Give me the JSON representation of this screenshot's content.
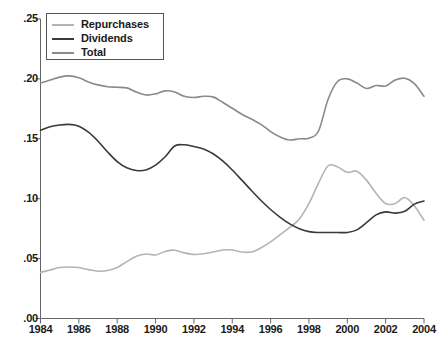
{
  "chart_data": {
    "type": "line",
    "title": "",
    "subtitle": "",
    "xlabel": "",
    "ylabel": "",
    "xlim": [
      1984,
      2004
    ],
    "ylim": [
      0.0,
      0.25
    ],
    "grid": false,
    "legend_position": "top-left",
    "x_tick_labels": [
      "1984",
      "1986",
      "1988",
      "1990",
      "1992",
      "1994",
      "1996",
      "1998",
      "2000",
      "2002",
      "2004"
    ],
    "x_ticks": [
      1984,
      1986,
      1988,
      1990,
      1992,
      1994,
      1996,
      1998,
      2000,
      2002,
      2004
    ],
    "y_tick_labels": [
      ".00",
      ".05",
      ".10",
      ".15",
      ".20",
      ".25"
    ],
    "y_ticks": [
      0.0,
      0.05,
      0.1,
      0.15,
      0.2,
      0.25
    ],
    "x": [
      1984.0,
      1984.5,
      1985.0,
      1985.5,
      1986.0,
      1986.5,
      1987.0,
      1987.5,
      1988.0,
      1988.5,
      1989.0,
      1989.5,
      1990.0,
      1990.5,
      1991.0,
      1991.5,
      1992.0,
      1992.5,
      1993.0,
      1993.5,
      1994.0,
      1994.5,
      1995.0,
      1995.5,
      1996.0,
      1996.5,
      1997.0,
      1997.5,
      1998.0,
      1998.5,
      1999.0,
      1999.5,
      2000.0,
      2000.5,
      2001.0,
      2001.5,
      2002.0,
      2002.5,
      2003.0,
      2003.5,
      2004.0
    ],
    "series": [
      {
        "name": "Repurchases",
        "color": "#b4b4b4",
        "values": [
          0.0385,
          0.0405,
          0.0425,
          0.043,
          0.0425,
          0.0408,
          0.0395,
          0.04,
          0.0425,
          0.0475,
          0.052,
          0.0538,
          0.053,
          0.056,
          0.057,
          0.0548,
          0.0535,
          0.054,
          0.0555,
          0.0572,
          0.0572,
          0.0555,
          0.0555,
          0.059,
          0.064,
          0.07,
          0.076,
          0.083,
          0.096,
          0.113,
          0.1275,
          0.1265,
          0.122,
          0.123,
          0.1155,
          0.1045,
          0.096,
          0.096,
          0.101,
          0.094,
          0.082
        ]
      },
      {
        "name": "Dividends",
        "color": "#3a3a3a",
        "values": [
          0.1572,
          0.16,
          0.1615,
          0.162,
          0.1605,
          0.1555,
          0.148,
          0.139,
          0.131,
          0.1258,
          0.1235,
          0.124,
          0.128,
          0.135,
          0.144,
          0.145,
          0.1435,
          0.1415,
          0.1375,
          0.1315,
          0.124,
          0.1155,
          0.1068,
          0.0985,
          0.091,
          0.0845,
          0.079,
          0.075,
          0.0725,
          0.0718,
          0.0718,
          0.0718,
          0.0718,
          0.074,
          0.08,
          0.0865,
          0.089,
          0.088,
          0.0895,
          0.0955,
          0.098
        ]
      },
      {
        "name": "Total",
        "color": "#8a8a8a",
        "values": [
          0.1965,
          0.199,
          0.2015,
          0.2025,
          0.201,
          0.1975,
          0.195,
          0.1935,
          0.193,
          0.1925,
          0.189,
          0.1865,
          0.1875,
          0.19,
          0.189,
          0.1855,
          0.1845,
          0.1855,
          0.185,
          0.1805,
          0.1755,
          0.1705,
          0.1665,
          0.162,
          0.156,
          0.1515,
          0.149,
          0.15,
          0.1505,
          0.1565,
          0.183,
          0.198,
          0.2,
          0.1965,
          0.192,
          0.1945,
          0.194,
          0.199,
          0.2005,
          0.196,
          0.1855
        ]
      }
    ]
  },
  "legend": {
    "entries": [
      {
        "label": "Repurchases",
        "color": "#b4b4b4"
      },
      {
        "label": "Dividends",
        "color": "#3a3a3a"
      },
      {
        "label": "Total",
        "color": "#8a8a8a"
      }
    ]
  },
  "axes": {
    "y_labels": [
      ".25",
      ".20",
      ".15",
      ".10",
      ".05",
      ".00"
    ],
    "x_labels": [
      "1984",
      "1986",
      "1988",
      "1990",
      "1992",
      "1994",
      "1996",
      "1998",
      "2000",
      "2002",
      "2004"
    ]
  }
}
